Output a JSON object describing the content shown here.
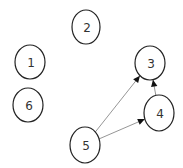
{
  "diagram": {
    "type": "directed-graph",
    "nodes": [
      {
        "id": "1",
        "label": "1"
      },
      {
        "id": "2",
        "label": "2"
      },
      {
        "id": "3",
        "label": "3"
      },
      {
        "id": "4",
        "label": "4"
      },
      {
        "id": "5",
        "label": "5"
      },
      {
        "id": "6",
        "label": "6"
      }
    ],
    "edges": [
      {
        "from": "5",
        "to": "3"
      },
      {
        "from": "5",
        "to": "4"
      },
      {
        "from": "4",
        "to": "3"
      }
    ]
  }
}
